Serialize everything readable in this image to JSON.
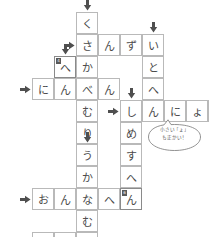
{
  "puzzle": {
    "title": "kanji-radical-crossword",
    "cell_size": 22,
    "colors": {
      "grid_line": "#b9b9b9",
      "grid_line_strong": "#8a8a8a",
      "text": "#4a4a4a",
      "arrow": "#4f4f4f",
      "number_box": "#5a5a5a",
      "background": "#ffffff"
    },
    "across_words": [
      {
        "id": "across-sanzui",
        "answer": "さんずい",
        "row": 1,
        "start_col": 3
      },
      {
        "id": "across-ninben",
        "answer": "にんべん",
        "row": 3,
        "start_col": 1
      },
      {
        "id": "across-shinnyou",
        "answer": "しんにょう",
        "row": 4,
        "start_col": 5
      },
      {
        "id": "across-onnahen",
        "answer": "おんなへん",
        "row": 8,
        "start_col": 1
      },
      {
        "id": "across-tsukuri",
        "answer": "つくり",
        "row": 10,
        "start_col": 1
      }
    ],
    "down_words": [
      {
        "id": "down-kusakanmuri",
        "answer": "くさかんむり",
        "col": 3,
        "start_row": 0
      },
      {
        "id": "down-itohen",
        "answer": "いとへん",
        "col": 6,
        "start_row": 1
      },
      {
        "id": "down-shimesuhen",
        "answer": "しめすへん",
        "col": 5,
        "start_row": 4
      },
      {
        "id": "down-ukanmuri",
        "answer": "うかんむり",
        "col": 3,
        "start_row": 6
      }
    ],
    "cells": [
      {
        "name": "cell-c3r0",
        "char": "く",
        "col": 3,
        "row": 0,
        "numbered": false,
        "number": ""
      },
      {
        "name": "cell-c3r1",
        "char": "さ",
        "col": 3,
        "row": 1,
        "numbered": false,
        "number": ""
      },
      {
        "name": "cell-c4r1",
        "char": "ん",
        "col": 4,
        "row": 1,
        "numbered": false,
        "number": ""
      },
      {
        "name": "cell-c5r1",
        "char": "ず",
        "col": 5,
        "row": 1,
        "numbered": false,
        "number": ""
      },
      {
        "name": "cell-c6r1",
        "char": "い",
        "col": 6,
        "row": 1,
        "numbered": false,
        "number": ""
      },
      {
        "name": "cell-c2r2",
        "char": "へ",
        "col": 2,
        "row": 2,
        "numbered": true,
        "number": "4"
      },
      {
        "name": "cell-c3r2",
        "char": "か",
        "col": 3,
        "row": 2,
        "numbered": false,
        "number": ""
      },
      {
        "name": "cell-c6r2",
        "char": "と",
        "col": 6,
        "row": 2,
        "numbered": false,
        "number": ""
      },
      {
        "name": "cell-c1r3",
        "char": "に",
        "col": 1,
        "row": 3,
        "numbered": false,
        "number": ""
      },
      {
        "name": "cell-c2r3",
        "char": "ん",
        "col": 2,
        "row": 3,
        "numbered": false,
        "number": ""
      },
      {
        "name": "cell-c3r3",
        "char": "べ",
        "col": 3,
        "row": 3,
        "numbered": false,
        "number": ""
      },
      {
        "name": "cell-c4r3",
        "char": "ん",
        "col": 4,
        "row": 3,
        "numbered": false,
        "number": ""
      },
      {
        "name": "cell-c6r3",
        "char": "へ",
        "col": 6,
        "row": 3,
        "numbered": false,
        "number": ""
      },
      {
        "name": "cell-c3r4",
        "char": "む",
        "col": 3,
        "row": 4,
        "numbered": false,
        "number": ""
      },
      {
        "name": "cell-c5r4",
        "char": "し",
        "col": 5,
        "row": 4,
        "numbered": false,
        "number": ""
      },
      {
        "name": "cell-c6r4",
        "char": "ん",
        "col": 6,
        "row": 4,
        "numbered": false,
        "number": ""
      },
      {
        "name": "cell-c7r4",
        "char": "に",
        "col": 7,
        "row": 4,
        "numbered": false,
        "number": ""
      },
      {
        "name": "cell-c8r4",
        "char": "ょ",
        "col": 8,
        "row": 4,
        "numbered": false,
        "number": ""
      },
      {
        "name": "cell-c9r4",
        "char": "う",
        "col": 9,
        "row": 4,
        "numbered": false,
        "number": ""
      },
      {
        "name": "cell-c3r5",
        "char": "り",
        "col": 3,
        "row": 5,
        "numbered": false,
        "number": ""
      },
      {
        "name": "cell-c5r5",
        "char": "め",
        "col": 5,
        "row": 5,
        "numbered": false,
        "number": ""
      },
      {
        "name": "cell-c3r6",
        "char": "う",
        "col": 3,
        "row": 6,
        "numbered": false,
        "number": ""
      },
      {
        "name": "cell-c5r6",
        "char": "す",
        "col": 5,
        "row": 6,
        "numbered": false,
        "number": ""
      },
      {
        "name": "cell-c3r7",
        "char": "か",
        "col": 3,
        "row": 7,
        "numbered": false,
        "number": ""
      },
      {
        "name": "cell-c5r7",
        "char": "へ",
        "col": 5,
        "row": 7,
        "numbered": false,
        "number": ""
      },
      {
        "name": "cell-c1r8",
        "char": "お",
        "col": 1,
        "row": 8,
        "numbered": false,
        "number": ""
      },
      {
        "name": "cell-c2r8",
        "char": "ん",
        "col": 2,
        "row": 8,
        "numbered": false,
        "number": ""
      },
      {
        "name": "cell-c3r8",
        "char": "な",
        "col": 3,
        "row": 8,
        "numbered": false,
        "number": ""
      },
      {
        "name": "cell-c4r8",
        "char": "へ",
        "col": 4,
        "row": 8,
        "numbered": false,
        "number": ""
      },
      {
        "name": "cell-c5r8",
        "char": "ん",
        "col": 5,
        "row": 8,
        "numbered": true,
        "number": "6"
      },
      {
        "name": "cell-c3r9",
        "char": "む",
        "col": 3,
        "row": 9,
        "numbered": false,
        "number": ""
      },
      {
        "name": "cell-c1r10",
        "char": "つ",
        "col": 1,
        "row": 10,
        "numbered": false,
        "number": ""
      },
      {
        "name": "cell-c2r10",
        "char": "く",
        "col": 2,
        "row": 10,
        "numbered": false,
        "number": ""
      },
      {
        "name": "cell-c3r10",
        "char": "り",
        "col": 3,
        "row": 10,
        "numbered": false,
        "number": ""
      }
    ],
    "arrows": [
      {
        "name": "arrow-down-kusakanmuri",
        "dir": "down",
        "col": 3,
        "row": 0
      },
      {
        "name": "arrow-down-itohen",
        "dir": "down",
        "col": 6,
        "row": 1
      },
      {
        "name": "arrow-right-sanzui",
        "dir": "right",
        "col": 3,
        "row": 1
      },
      {
        "name": "arrow-down-hen",
        "dir": "down",
        "col": 2,
        "row": 2
      },
      {
        "name": "arrow-right-ninben",
        "dir": "right",
        "col": 1,
        "row": 3
      },
      {
        "name": "arrow-down-shimesuhen",
        "dir": "down",
        "col": 5,
        "row": 4
      },
      {
        "name": "arrow-right-shinnyou",
        "dir": "right",
        "col": 5,
        "row": 4
      },
      {
        "name": "arrow-down-ukanmuri",
        "dir": "down",
        "col": 3,
        "row": 6
      },
      {
        "name": "arrow-right-onnahen",
        "dir": "right",
        "col": 1,
        "row": 8
      },
      {
        "name": "arrow-right-tsukuri",
        "dir": "right",
        "col": 1,
        "row": 10
      }
    ]
  },
  "hint_bubble": {
    "name": "hint-speech-bubble",
    "line1": "小さい「ょ」",
    "line2": "も正かい！"
  }
}
